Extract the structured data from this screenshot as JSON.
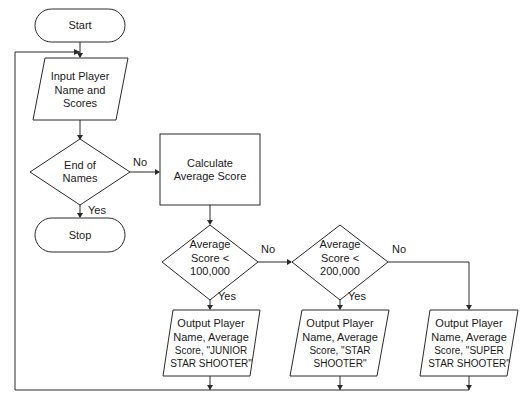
{
  "diagram": {
    "type": "flowchart",
    "nodes": {
      "start": {
        "shape": "terminator",
        "lines": [
          "Start"
        ]
      },
      "input": {
        "shape": "parallelogram",
        "lines": [
          "Input Player",
          "Name and",
          "Scores"
        ]
      },
      "end_decision": {
        "shape": "diamond",
        "lines": [
          "End of",
          "Names"
        ]
      },
      "stop": {
        "shape": "terminator",
        "lines": [
          "Stop"
        ]
      },
      "calculate": {
        "shape": "rectangle",
        "lines": [
          "Calculate",
          "Average Score"
        ]
      },
      "decision1": {
        "shape": "diamond",
        "lines": [
          "Average",
          "Score <",
          "100,000"
        ]
      },
      "decision2": {
        "shape": "diamond",
        "lines": [
          "Average",
          "Score <",
          "200,000"
        ]
      },
      "output1": {
        "shape": "parallelogram",
        "lines": [
          "Output Player",
          "Name, Average",
          "Score, \"JUNIOR",
          "STAR SHOOTER\""
        ]
      },
      "output2": {
        "shape": "parallelogram",
        "lines": [
          "Output Player",
          "Name, Average",
          "Score, \"STAR",
          "SHOOTER\""
        ]
      },
      "output3": {
        "shape": "parallelogram",
        "lines": [
          "Output Player",
          "Name, Average",
          "Score, \"SUPER",
          "STAR SHOOTER\""
        ]
      }
    },
    "edge_labels": {
      "end_no": "No",
      "end_yes": "Yes",
      "d1_no": "No",
      "d1_yes": "Yes",
      "d2_no": "No",
      "d2_yes": "Yes"
    }
  }
}
